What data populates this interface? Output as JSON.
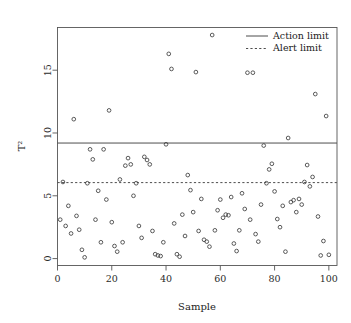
{
  "chart_data": {
    "type": "scatter",
    "title": "",
    "xlabel": "Sample",
    "ylabel": "T²",
    "xlim": [
      0,
      103
    ],
    "ylim": [
      -0.55,
      18.4
    ],
    "xticks": [
      0,
      20,
      40,
      60,
      80,
      100
    ],
    "yticks": [
      0,
      5,
      10,
      15
    ],
    "xtick_labels": [
      "0",
      "20",
      "40",
      "60",
      "80",
      "100"
    ],
    "ytick_labels": [
      "0",
      "5",
      "10",
      "15"
    ],
    "grid": false,
    "legend_position": "top-right",
    "series": [
      {
        "name": "T2",
        "marker": "open-circle",
        "x": [
          1,
          2,
          3,
          4,
          5,
          6,
          7,
          8,
          9,
          10,
          11,
          12,
          13,
          14,
          15,
          16,
          17,
          18,
          19,
          20,
          21,
          22,
          23,
          24,
          25,
          26,
          27,
          28,
          29,
          30,
          31,
          32,
          33,
          34,
          35,
          36,
          37,
          38,
          39,
          40,
          41,
          42,
          43,
          44,
          45,
          46,
          47,
          48,
          49,
          50,
          51,
          52,
          53,
          54,
          55,
          56,
          57,
          58,
          59,
          60,
          61,
          62,
          63,
          64,
          65,
          66,
          67,
          68,
          69,
          70,
          71,
          72,
          73,
          74,
          75,
          76,
          77,
          78,
          79,
          80,
          81,
          82,
          83,
          84,
          85,
          86,
          87,
          88,
          89,
          90,
          91,
          92,
          93,
          94,
          95,
          96,
          97,
          98,
          99,
          100
        ],
        "y": [
          3.1,
          6.1,
          2.6,
          4.2,
          2.0,
          11.1,
          3.4,
          2.3,
          0.7,
          0.1,
          6.0,
          8.7,
          7.9,
          3.1,
          5.4,
          1.3,
          8.7,
          4.7,
          11.8,
          2.9,
          1.0,
          0.55,
          6.3,
          1.3,
          7.4,
          8.0,
          7.5,
          5.0,
          6.0,
          2.6,
          1.65,
          8.1,
          7.85,
          7.5,
          2.2,
          0.35,
          0.25,
          0.2,
          1.3,
          9.1,
          16.3,
          15.1,
          2.8,
          0.35,
          0.15,
          3.5,
          1.8,
          6.65,
          5.45,
          3.7,
          14.85,
          2.2,
          4.75,
          1.5,
          1.35,
          0.95,
          17.8,
          2.25,
          3.85,
          4.7,
          3.25,
          3.5,
          3.45,
          4.9,
          1.2,
          0.6,
          2.25,
          5.2,
          3.95,
          14.8,
          3.1,
          14.8,
          1.95,
          1.35,
          4.3,
          9.0,
          6.0,
          7.1,
          7.55,
          5.35,
          3.15,
          2.5,
          4.2,
          0.55,
          9.6,
          4.5,
          4.65,
          3.7,
          4.75,
          4.3,
          6.1,
          7.45,
          5.75,
          6.5,
          13.1,
          3.35,
          0.25,
          1.4,
          11.35,
          0.3
        ]
      }
    ],
    "reference_lines": [
      {
        "label": "Action limit",
        "value": 9.2,
        "style": "solid"
      },
      {
        "label": "Alert limit",
        "value": 6.05,
        "style": "dashed"
      }
    ],
    "legend": [
      {
        "label": "Action limit",
        "style": "solid"
      },
      {
        "label": "Alert limit",
        "style": "dashed"
      }
    ],
    "colors": {
      "point_stroke": "#3d3d3d",
      "frame": "#555555",
      "reference_line": "#4d4d4d",
      "background": "#ffffff"
    }
  }
}
